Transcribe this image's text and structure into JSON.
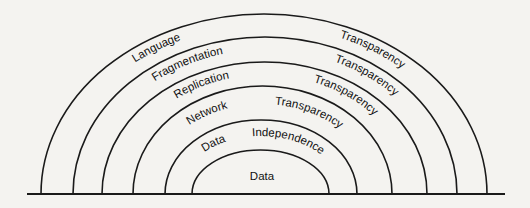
{
  "diagram": {
    "type": "nested-arcs",
    "layers": [
      {
        "name": "language-transparency",
        "left_label": "Language",
        "right_label": "Transparency"
      },
      {
        "name": "fragmentation-transparency",
        "left_label": "Fragmentation",
        "right_label": "Transparency"
      },
      {
        "name": "replication-transparency",
        "left_label": "Replication",
        "right_label": "Transparency"
      },
      {
        "name": "network-transparency",
        "left_label": "Network",
        "right_label": "Transparency"
      },
      {
        "name": "data-independence",
        "left_label": "Data",
        "right_label": "Independence"
      }
    ],
    "core_label": "Data"
  }
}
